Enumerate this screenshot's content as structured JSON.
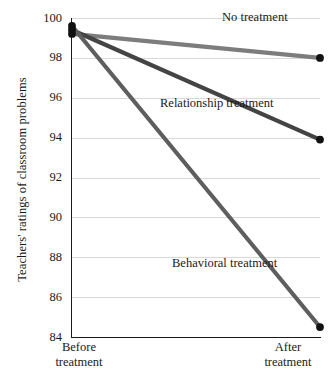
{
  "chart_data": {
    "type": "line",
    "title": "",
    "subtitle": "",
    "xlabel": "",
    "ylabel": "Teachers' ratings of classroom problems",
    "categories": [
      "Before treatment",
      "After treatment"
    ],
    "x": [
      0,
      1
    ],
    "ylim": [
      84,
      100
    ],
    "xlim": [
      0,
      1
    ],
    "yticks": [
      84,
      86,
      88,
      90,
      92,
      94,
      96,
      98,
      100
    ],
    "ytick_labels": [
      "84",
      "86",
      "88",
      "90",
      "92",
      "94",
      "96",
      "98",
      "100"
    ],
    "grid": "horizontal",
    "legend_position": "inline-annotations",
    "markers": "filled-circle",
    "series": [
      {
        "name": "No treatment",
        "label_line1": "No",
        "label_line2": "treatment",
        "values": [
          99.2,
          98.0
        ],
        "color": "#7d7d7d"
      },
      {
        "name": "Relationship treatment",
        "label_line1": "Relationship",
        "label_line2": "treatment",
        "values": [
          99.4,
          93.9
        ],
        "color": "#444444"
      },
      {
        "name": "Behavioral treatment",
        "label_line1": "Behavioral",
        "label_line2": "treatment",
        "values": [
          99.6,
          84.5
        ],
        "color": "#5e5e5e"
      }
    ],
    "xtick_labels": [
      {
        "line1": "Before",
        "line2": "treatment"
      },
      {
        "line1": "After",
        "line2": "treatment"
      }
    ],
    "marker_color": "#111111",
    "axis_color": "#1a1a1a",
    "grid_color": "#d9d9d9",
    "background": "#ffffff"
  }
}
